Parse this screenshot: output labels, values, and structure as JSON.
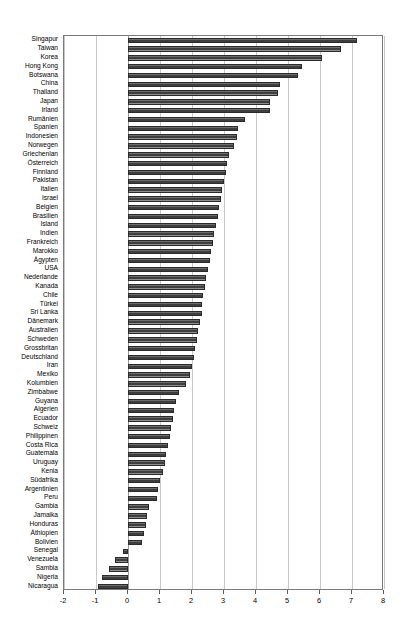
{
  "chart_data": {
    "type": "bar",
    "orientation": "horizontal",
    "title": "",
    "subtitle": "",
    "xlabel": "",
    "ylabel": "",
    "xlim": [
      -2,
      8
    ],
    "ylim": null,
    "grid": true,
    "legend": null,
    "legend_position": "none",
    "bar_color": "#4a4a4a",
    "xticks": [
      -2,
      -1,
      0,
      1,
      2,
      3,
      4,
      5,
      6,
      7,
      8
    ],
    "xticklabels": [
      "-2",
      "-1",
      "0",
      "1",
      "2",
      "3",
      "4",
      "5",
      "6",
      "7",
      "8"
    ],
    "categories": [
      "Singapur",
      "Taiwan",
      "Korea",
      "Hong Kong",
      "Botswana",
      "China",
      "Thailand",
      "Japan",
      "Irland",
      "Rumänien",
      "Spanien",
      "Indonesien",
      "Norwegen",
      "Griechenlan",
      "Österreich",
      "Finnland",
      "Pakistan",
      "Italien",
      "Israel",
      "Belgien",
      "Brasilien",
      "Island",
      "Indien",
      "Frankreich",
      "Marokko",
      "Ägypten",
      "USA",
      "Nederlande",
      "Kanada",
      "Chile",
      "Türkei",
      "Sri Lanka",
      "Dänemark",
      "Australien",
      "Schweden",
      "Grossbritan",
      "Deutschland",
      "Iran",
      "Mexiko",
      "Kolumbien",
      "Zimbabwe",
      "Guyana",
      "Algerien",
      "Ecuador",
      "Schweiz",
      "Philippinen",
      "Costa Rica",
      "Guatemala",
      "Uruguay",
      "Kenia",
      "Südafrika",
      "Argentinien",
      "Peru",
      "Gambia",
      "Jamaika",
      "Honduras",
      "Äthiopien",
      "Bolivien",
      "Senegal",
      "Venezuela",
      "Sambia",
      "Nigeria",
      "Nicaragua"
    ],
    "values": [
      7.15,
      6.65,
      6.05,
      5.45,
      5.3,
      4.75,
      4.7,
      4.45,
      4.45,
      3.65,
      3.45,
      3.4,
      3.3,
      3.15,
      3.1,
      3.05,
      3.0,
      2.95,
      2.9,
      2.85,
      2.8,
      2.75,
      2.7,
      2.65,
      2.6,
      2.55,
      2.5,
      2.45,
      2.4,
      2.35,
      2.3,
      2.3,
      2.25,
      2.2,
      2.15,
      2.1,
      2.05,
      2.0,
      1.95,
      1.8,
      1.6,
      1.5,
      1.45,
      1.4,
      1.35,
      1.3,
      1.25,
      1.2,
      1.15,
      1.1,
      1.0,
      0.95,
      0.9,
      0.65,
      0.6,
      0.55,
      0.5,
      0.45,
      -0.15,
      -0.4,
      -0.6,
      -0.8,
      -0.95
    ]
  }
}
